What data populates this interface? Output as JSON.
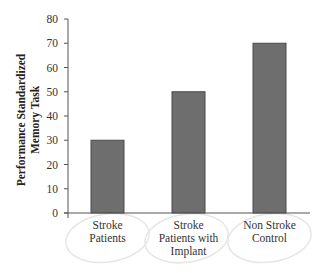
{
  "chart_data": {
    "type": "bar",
    "title": "",
    "xlabel": "",
    "ylabel": "Performance Standardized Memory Task",
    "ylabel_lines": [
      "Performance Standardized",
      "Memory Task"
    ],
    "categories": [
      "Stroke Patients",
      "Stroke Patients with Implant",
      "Non Stroke Control"
    ],
    "category_lines": [
      [
        "Stroke",
        "Patients"
      ],
      [
        "Stroke",
        "Patients with",
        "Implant"
      ],
      [
        "Non Stroke",
        "Control"
      ]
    ],
    "values": [
      30,
      50,
      70
    ],
    "ylim": [
      0,
      80
    ],
    "yticks": [
      0,
      10,
      20,
      30,
      40,
      50,
      60,
      70,
      80
    ],
    "grid": false,
    "legend": null,
    "colors": {
      "bar_fill": "#6e6e6e",
      "bar_edge": "#4a4a4a",
      "axis": "#555555",
      "annotation_ellipse": "#e6e6e6"
    },
    "annotations": [
      "light hand-drawn ellipses around category labels"
    ]
  }
}
